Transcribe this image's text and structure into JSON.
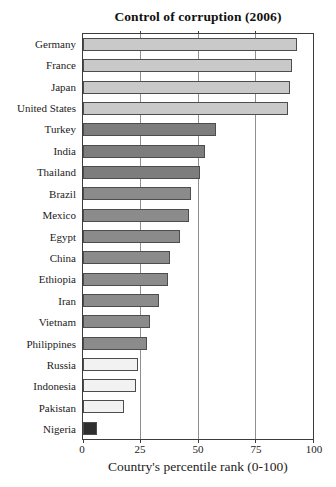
{
  "chart_data": {
    "type": "bar",
    "orientation": "horizontal",
    "title": "Control of corruption (2006)",
    "xlabel": "Country's percentile rank (0-100)",
    "xlim": [
      0,
      100
    ],
    "xticks": [
      0,
      25,
      50,
      75,
      100
    ],
    "gridlines_at": [
      25,
      50,
      75
    ],
    "legend": "none",
    "palette": {
      "light_gray": "#c9c9c9",
      "dark_gray": "#7d7d7d",
      "medium_gray": "#8b8b8b",
      "pale_gray": "#f2f2f2",
      "near_black": "#2f2f2f"
    },
    "bar_border_color": "#4d4d4d",
    "categories": [
      "Germany",
      "France",
      "Japan",
      "United States",
      "Turkey",
      "India",
      "Thailand",
      "Brazil",
      "Mexico",
      "Egypt",
      "China",
      "Ethiopia",
      "Iran",
      "Vietnam",
      "Philippines",
      "Russia",
      "Indonesia",
      "Pakistan",
      "Nigeria"
    ],
    "values": [
      93,
      91,
      90,
      89,
      58,
      53,
      51,
      47,
      46,
      42,
      38,
      37,
      33,
      29,
      28,
      24,
      23,
      18,
      6
    ],
    "bars": [
      {
        "country": "Germany",
        "value": 93,
        "group": "light_gray"
      },
      {
        "country": "France",
        "value": 91,
        "group": "light_gray"
      },
      {
        "country": "Japan",
        "value": 90,
        "group": "light_gray"
      },
      {
        "country": "United States",
        "value": 89,
        "group": "light_gray"
      },
      {
        "country": "Turkey",
        "value": 58,
        "group": "dark_gray"
      },
      {
        "country": "India",
        "value": 53,
        "group": "dark_gray"
      },
      {
        "country": "Thailand",
        "value": 51,
        "group": "dark_gray"
      },
      {
        "country": "Brazil",
        "value": 47,
        "group": "medium_gray"
      },
      {
        "country": "Mexico",
        "value": 46,
        "group": "medium_gray"
      },
      {
        "country": "Egypt",
        "value": 42,
        "group": "medium_gray"
      },
      {
        "country": "China",
        "value": 38,
        "group": "medium_gray"
      },
      {
        "country": "Ethiopia",
        "value": 37,
        "group": "medium_gray"
      },
      {
        "country": "Iran",
        "value": 33,
        "group": "medium_gray"
      },
      {
        "country": "Vietnam",
        "value": 29,
        "group": "medium_gray"
      },
      {
        "country": "Philippines",
        "value": 28,
        "group": "medium_gray"
      },
      {
        "country": "Russia",
        "value": 24,
        "group": "pale_gray"
      },
      {
        "country": "Indonesia",
        "value": 23,
        "group": "pale_gray"
      },
      {
        "country": "Pakistan",
        "value": 18,
        "group": "pale_gray"
      },
      {
        "country": "Nigeria",
        "value": 6,
        "group": "near_black"
      }
    ]
  }
}
